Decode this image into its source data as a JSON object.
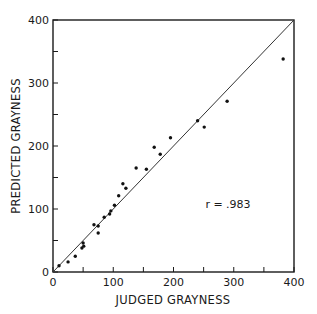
{
  "chart_data": {
    "type": "scatter",
    "title": "",
    "xlabel": "JUDGED GRAYNESS",
    "ylabel": "PREDICTED GRAYNESS",
    "xlim": [
      0,
      400
    ],
    "ylim": [
      0,
      400
    ],
    "x_ticks": [
      0,
      100,
      200,
      300,
      400
    ],
    "y_ticks": [
      0,
      100,
      200,
      300,
      400
    ],
    "x_minor_ticks": [
      50,
      150,
      250,
      350
    ],
    "y_minor_ticks": [
      50,
      150,
      250,
      350
    ],
    "grid": false,
    "legend": null,
    "reference_line": {
      "type": "identity",
      "from": [
        0,
        0
      ],
      "to": [
        400,
        400
      ]
    },
    "annotation": "r = .983",
    "series": [
      {
        "name": "observations",
        "points": [
          [
            10,
            10
          ],
          [
            25,
            16
          ],
          [
            37,
            25
          ],
          [
            48,
            38
          ],
          [
            51,
            41
          ],
          [
            50,
            46
          ],
          [
            68,
            75
          ],
          [
            75,
            73
          ],
          [
            75,
            62
          ],
          [
            85,
            87
          ],
          [
            94,
            92
          ],
          [
            96,
            97
          ],
          [
            102,
            106
          ],
          [
            109,
            121
          ],
          [
            116,
            140
          ],
          [
            121,
            133
          ],
          [
            138,
            165
          ],
          [
            155,
            163
          ],
          [
            168,
            198
          ],
          [
            178,
            187
          ],
          [
            195,
            213
          ],
          [
            240,
            240
          ],
          [
            251,
            230
          ],
          [
            289,
            271
          ],
          [
            382,
            338
          ]
        ]
      }
    ]
  },
  "labels": {
    "x_axis_title": "JUDGED GRAYNESS",
    "y_axis_title": "PREDICTED GRAYNESS",
    "correlation": "r = .983",
    "x_tick_labels": [
      "0",
      "100",
      "200",
      "300",
      "400"
    ],
    "y_tick_labels": [
      "0",
      "100",
      "200",
      "300",
      "400"
    ]
  },
  "colors": {
    "axis": "#1a1a1a",
    "points": "#111111",
    "reference_line": "#333333"
  }
}
